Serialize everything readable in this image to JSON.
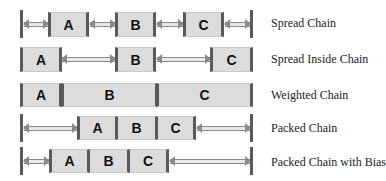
{
  "rows": [
    {
      "label": "Spread Chain",
      "boxes": [
        "A",
        "B",
        "C"
      ]
    },
    {
      "label": "Spread Inside Chain",
      "boxes": [
        "A",
        "B",
        "C"
      ]
    },
    {
      "label": "Weighted Chain",
      "boxes": [
        "A",
        "B",
        "C"
      ]
    },
    {
      "label": "Packed Chain",
      "boxes": [
        "A",
        "B",
        "C"
      ]
    },
    {
      "label": "Packed Chain with Bias",
      "boxes": [
        "A",
        "B",
        "C"
      ]
    }
  ],
  "colors": {
    "box_fill": "#dcdcdc",
    "bar": "#5a5a5a",
    "arrow": "#8a8a8a"
  }
}
